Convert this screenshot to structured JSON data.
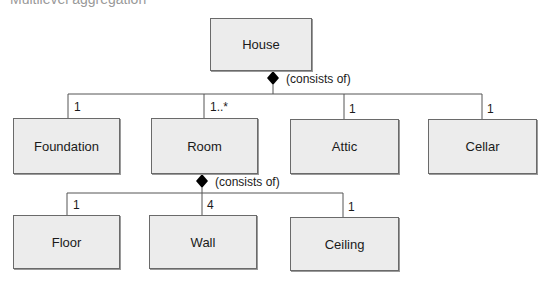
{
  "cropped_caption": "Multilevel aggregation",
  "classes": {
    "house": "House",
    "foundation": "Foundation",
    "room": "Room",
    "attic": "Attic",
    "cellar": "Cellar",
    "floor": "Floor",
    "wall": "Wall",
    "ceiling": "Ceiling"
  },
  "relations": {
    "house_composition": "(consists of)",
    "room_composition": "(consists of)"
  },
  "multiplicities": {
    "foundation": "1",
    "room": "1..*",
    "attic": "1",
    "cellar": "1",
    "floor": "1",
    "wall": "4",
    "ceiling": "1"
  },
  "colors": {
    "box_fill": "#ececec",
    "box_border": "#6a6a6a",
    "line": "#555555",
    "diamond": "#000000"
  }
}
